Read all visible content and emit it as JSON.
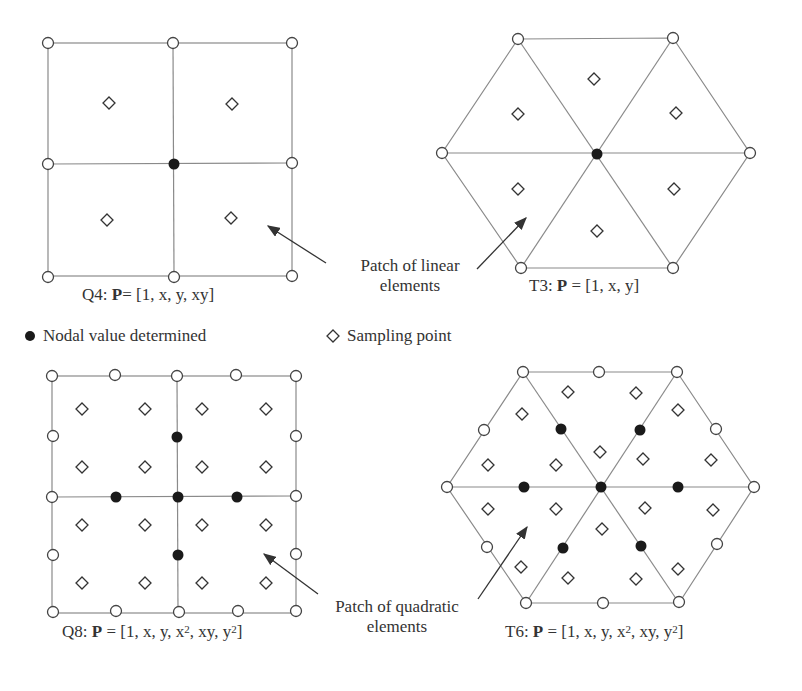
{
  "diagram": {
    "panels": [
      {
        "id": "Q4",
        "caption_prefix": "Q4: ",
        "caption_bold": "P",
        "caption_rest": "= [1, x, y, xy]",
        "element_type": "4-node quadrilateral"
      },
      {
        "id": "T3",
        "caption_prefix": "T3: ",
        "caption_bold": "P",
        "caption_rest": " = [1, x, y]",
        "element_type": "3-node triangle"
      },
      {
        "id": "Q8",
        "caption_prefix": "Q8: ",
        "caption_bold": "P",
        "caption_rest_a": " = [1, x, y, x",
        "sup1": "2",
        "caption_rest_b": ", xy, y",
        "sup2": "2",
        "caption_rest_c": "]",
        "element_type": "8-node quadrilateral"
      },
      {
        "id": "T6",
        "caption_prefix": "T6: ",
        "caption_bold": "P",
        "caption_rest_a": " = [1, x, y, x",
        "sup1": "2",
        "caption_rest_b": ", xy, y",
        "sup2": "2",
        "caption_rest_c": "]",
        "element_type": "6-node triangle"
      }
    ],
    "annotations": {
      "linear_line1": "Patch of linear",
      "linear_line2": "elements",
      "quadratic_line1": "Patch of quadratic",
      "quadratic_line2": "elements"
    },
    "legend": {
      "filled_dot_label": "Nodal value determined",
      "diamond_label": "Sampling point"
    },
    "colors": {
      "line": "#8a8a8a",
      "node_outline": "#444444",
      "filled_node": "#1a1a1a",
      "text": "#333333"
    }
  }
}
